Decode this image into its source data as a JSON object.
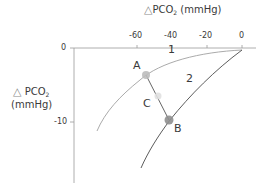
{
  "x_axis": {
    "label_symbol": "△",
    "label_main": "PCO",
    "label_sub": "2",
    "label_unit": " (mmHg)",
    "ticks": [
      "-60",
      "-40",
      "-20",
      "0"
    ]
  },
  "y_axis": {
    "label_symbol": "△",
    "label_main": "PCO",
    "label_sub": "2",
    "label_unit": "(mmHg)",
    "ticks": [
      "0",
      "-10"
    ]
  },
  "curves": [
    {
      "label": "1",
      "color": "#9a9a9a"
    },
    {
      "label": "2",
      "color": "#4a4a4a"
    }
  ],
  "points": [
    {
      "label": "A",
      "color": "#b8b8b8"
    },
    {
      "label": "B",
      "color": "#8c8c8c"
    },
    {
      "label": "C",
      "color": "#d8d8d8"
    }
  ]
}
